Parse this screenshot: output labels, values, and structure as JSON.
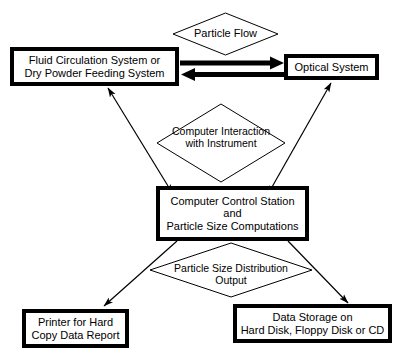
{
  "diagram": {
    "background_color": "#ffffff",
    "line_color": "#000000",
    "nodes": {
      "fluid_circulation": {
        "shape": "process-box",
        "line1": "Fluid Circulation System or",
        "line2": "Dry Powder Feeding System"
      },
      "optical_system": {
        "shape": "process-box",
        "line1": "Optical System"
      },
      "computer_control": {
        "shape": "process-box",
        "line1": "Computer Control Station",
        "line2": "and",
        "line3": "Particle Size Computations"
      },
      "printer": {
        "shape": "process-box",
        "line1": "Printer for Hard",
        "line2": "Copy Data Report"
      },
      "data_storage": {
        "shape": "process-box",
        "line1": "Data Storage on",
        "line2": "Hard Disk, Floppy Disk or CD"
      }
    },
    "diamonds": {
      "particle_flow": {
        "shape": "diamond",
        "line1": "Particle Flow"
      },
      "computer_interaction": {
        "shape": "diamond",
        "line1": "Computer Interaction",
        "line2": "with Instrument"
      },
      "particle_size_output": {
        "shape": "diamond",
        "line1": "Particle Size Distribution",
        "line2": "Output"
      }
    },
    "connectors": [
      {
        "name": "particle-flow-forward-arrow",
        "from": "fluid_circulation",
        "to": "optical_system",
        "style": "thick",
        "heads": "single",
        "direction": "right"
      },
      {
        "name": "particle-flow-return-arrow",
        "from": "optical_system",
        "to": "fluid_circulation",
        "style": "thick",
        "heads": "single",
        "direction": "left"
      },
      {
        "name": "computer-fluid-interaction-arrow",
        "from": "computer_control",
        "to": "fluid_circulation",
        "style": "thin",
        "heads": "double",
        "direction": "diagonal-up-left"
      },
      {
        "name": "computer-optical-interaction-arrow",
        "from": "computer_control",
        "to": "optical_system",
        "style": "thin",
        "heads": "double",
        "direction": "diagonal-up-right"
      },
      {
        "name": "output-to-printer-arrow",
        "from": "computer_control",
        "to": "printer",
        "style": "thin",
        "heads": "single",
        "direction": "diagonal-down-left"
      },
      {
        "name": "output-to-storage-arrow",
        "from": "computer_control",
        "to": "data_storage",
        "style": "thin",
        "heads": "single",
        "direction": "diagonal-down-right"
      }
    ]
  }
}
